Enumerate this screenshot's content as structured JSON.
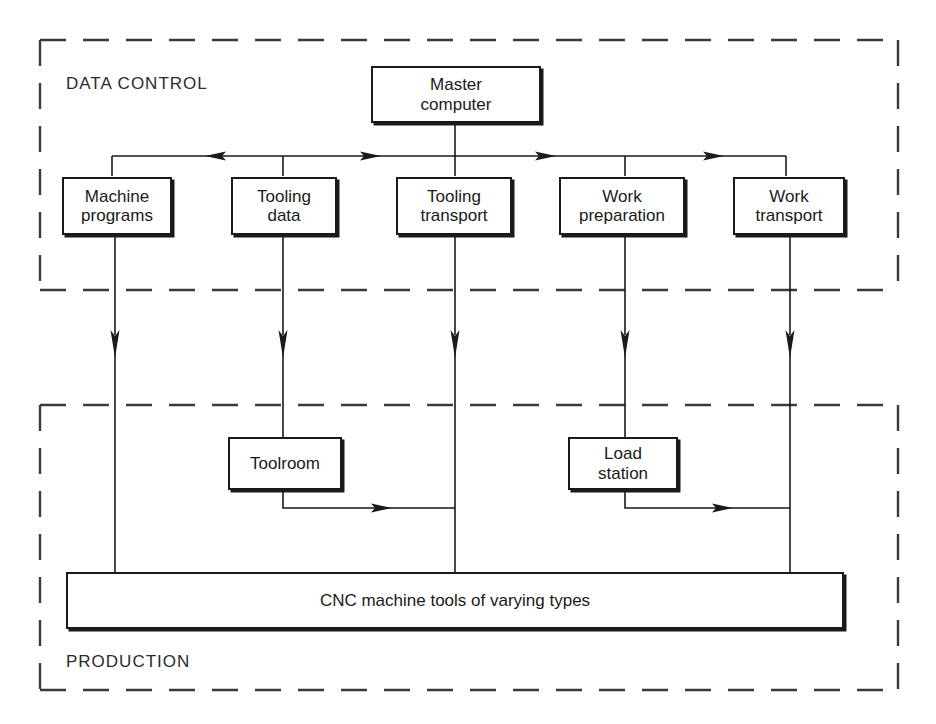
{
  "diagram": {
    "title": "",
    "zones": [
      {
        "id": "data-control",
        "label": "DATA CONTROL"
      },
      {
        "id": "production",
        "label": "PRODUCTION"
      }
    ],
    "nodes": {
      "master": "Master\ncomputer",
      "master_line1": "Master",
      "master_line2": "computer",
      "machine_programs_l1": "Machine",
      "machine_programs_l2": "programs",
      "tooling_data_l1": "Tooling",
      "tooling_data_l2": "data",
      "tooling_transport_l1": "Tooling",
      "tooling_transport_l2": "transport",
      "work_preparation_l1": "Work",
      "work_preparation_l2": "preparation",
      "work_transport_l1": "Work",
      "work_transport_l2": "transport",
      "toolroom": "Toolroom",
      "load_station_l1": "Load",
      "load_station_l2": "station",
      "cnc_bar": "CNC machine tools of varying types"
    },
    "colors": {
      "stroke": "#1a1a1a",
      "dashed_border": "#3a3a3a",
      "background": "#ffffff",
      "text": "#1a1a1a",
      "zone_label_text": "#2b2b2b"
    },
    "connections": [
      {
        "from": "master",
        "to": "data-bus",
        "type": "vertical-line"
      },
      {
        "from": "data-bus",
        "to": "machine-programs",
        "type": "bus-drop",
        "arrow": "left"
      },
      {
        "from": "data-bus",
        "to": "tooling-data",
        "type": "bus-drop",
        "arrow": "right"
      },
      {
        "from": "data-bus",
        "to": "tooling-transport",
        "type": "bus-drop",
        "arrow": "right"
      },
      {
        "from": "data-bus",
        "to": "work-preparation",
        "type": "bus-drop",
        "arrow": "right"
      },
      {
        "from": "data-bus",
        "to": "work-transport",
        "type": "bus-drop"
      },
      {
        "from": "machine-programs",
        "to": "cnc-machine-tools",
        "type": "vertical-arrow"
      },
      {
        "from": "tooling-data",
        "to": "toolroom",
        "type": "vertical-arrow"
      },
      {
        "from": "tooling-transport",
        "to": "cnc-machine-tools",
        "type": "vertical-arrow"
      },
      {
        "from": "work-preparation",
        "to": "load-station",
        "type": "vertical-arrow"
      },
      {
        "from": "work-transport",
        "to": "cnc-machine-tools",
        "type": "vertical-arrow"
      },
      {
        "from": "toolroom",
        "to": "tooling-transport-column",
        "type": "elbow-arrow",
        "arrow": "right"
      },
      {
        "from": "load-station",
        "to": "work-transport-column",
        "type": "elbow-arrow",
        "arrow": "right"
      }
    ]
  }
}
